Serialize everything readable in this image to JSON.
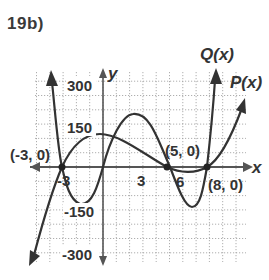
{
  "problem": {
    "label": "19b)"
  },
  "chart_data": {
    "type": "line",
    "title": "19b)",
    "xlabel": "x",
    "ylabel": "y",
    "xlim": [
      -5,
      11
    ],
    "ylim": [
      -350,
      350
    ],
    "grid": true,
    "x_ticks": [
      {
        "value": -3,
        "label": "-3"
      },
      {
        "value": 3,
        "label": "3"
      },
      {
        "value": 6,
        "label": "6"
      }
    ],
    "y_ticks": [
      {
        "value": 300,
        "label": "300"
      },
      {
        "value": 150,
        "label": "150"
      },
      {
        "value": -150,
        "label": "-150"
      },
      {
        "value": -300,
        "label": "-300"
      }
    ],
    "series": [
      {
        "name": "Q(x)",
        "label": "Q(x)",
        "description": "quartic, rises steeply on both ends",
        "points": [
          [
            -3.7,
            330
          ],
          [
            -3,
            0
          ],
          [
            -2.4,
            -120
          ],
          [
            -1.5,
            -140
          ],
          [
            0,
            0
          ],
          [
            1,
            130
          ],
          [
            2.3,
            185
          ],
          [
            3.5,
            140
          ],
          [
            5,
            0
          ],
          [
            6,
            -130
          ],
          [
            6.8,
            -140
          ],
          [
            8,
            0
          ],
          [
            8.5,
            340
          ]
        ]
      },
      {
        "name": "P(x)",
        "label": "P(x)",
        "description": "cubic, falls to the left, rises to the right, double root at x=8",
        "points": [
          [
            -5.5,
            -330
          ],
          [
            -4,
            -120
          ],
          [
            -3,
            0
          ],
          [
            -2,
            70
          ],
          [
            -0.5,
            115
          ],
          [
            1,
            100
          ],
          [
            3,
            50
          ],
          [
            5,
            0
          ],
          [
            6.5,
            -15
          ],
          [
            8,
            0
          ],
          [
            9,
            50
          ],
          [
            10.4,
            230
          ]
        ]
      }
    ],
    "annotations": [
      {
        "text": "(-3, 0)",
        "x": -3,
        "y": 0
      },
      {
        "text": "(5, 0)",
        "x": 5,
        "y": 0
      },
      {
        "text": "(8, 0)",
        "x": 8,
        "y": 0
      }
    ]
  }
}
